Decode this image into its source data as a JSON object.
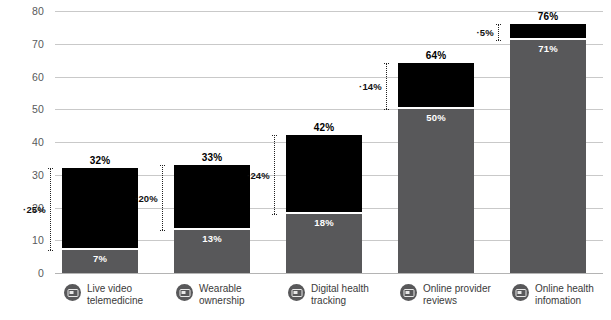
{
  "chart_data": {
    "type": "bar",
    "subtype": "stacked-bar-with-delta-annotations",
    "title": "",
    "xlabel": "",
    "ylabel": "",
    "ylim": [
      0,
      80
    ],
    "yticks": [
      0,
      10,
      20,
      30,
      40,
      50,
      60,
      70,
      80
    ],
    "grid": true,
    "legend": "none",
    "categories": [
      "Live video\ntelemedicine",
      "Wearable\nownership",
      "Digital health\ntracking",
      "Online provider\nreviews",
      "Online health\ninfomation"
    ],
    "series": [
      {
        "name": "base",
        "color": "#58585a",
        "values": [
          7,
          13,
          18,
          50,
          71
        ]
      },
      {
        "name": "increase",
        "color": "#000000",
        "values": [
          25,
          20,
          24,
          14,
          5
        ]
      }
    ],
    "totals": [
      32,
      33,
      42,
      64,
      76
    ],
    "bar_labels": {
      "base": [
        "7%",
        "13%",
        "18%",
        "50%",
        "71%"
      ],
      "total": [
        "32%",
        "33%",
        "42%",
        "64%",
        "76%"
      ]
    },
    "delta_labels": [
      "25%",
      "20%",
      "24%",
      "14%",
      "5%"
    ],
    "ytick_labels": [
      "0",
      "10",
      "20",
      "30",
      "40",
      "50",
      "60",
      "70",
      "80"
    ],
    "colors": {
      "base": "#58585a",
      "increase": "#000000",
      "grid": "#c9c9c9",
      "axis_text": "#58595b",
      "background": "#ffffff"
    }
  },
  "icons": {
    "category": "monitor-icon"
  }
}
